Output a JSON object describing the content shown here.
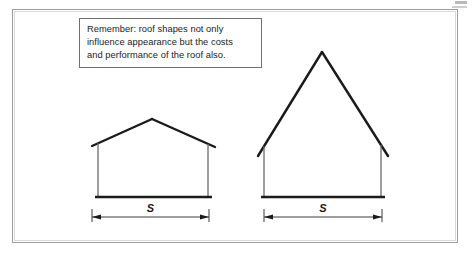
{
  "figure": {
    "background_color": "#ffffff",
    "line_color": "#1b1b1b",
    "frame_color": "#9d9d9d"
  },
  "note": {
    "border_color": "#6f6f6f",
    "lines": [
      "Remember: roof shapes not only",
      "influence appearance but the costs",
      "and performance of the roof also."
    ],
    "text": "Remember: roof shapes not only influence appearance but the costs and performance of the roof also."
  },
  "houses": [
    {
      "name": "low-pitch-gable-house",
      "span_label": "S",
      "eave_left": {
        "x": 92,
        "y": 146
      },
      "eave_right": {
        "x": 215,
        "y": 147
      },
      "ridge": {
        "x": 152,
        "y": 119
      },
      "wall_left_x": 98,
      "wall_right_x": 208,
      "baseline_y": 197,
      "baseline_x1": 95,
      "baseline_x2": 212
    },
    {
      "name": "steep-pitch-gable-house",
      "span_label": "S",
      "eave_left": {
        "x": 258,
        "y": 156
      },
      "eave_right": {
        "x": 388,
        "y": 156
      },
      "ridge": {
        "x": 322,
        "y": 52
      },
      "wall_left_x": 264,
      "wall_right_x": 381,
      "baseline_y": 197,
      "baseline_x1": 261,
      "baseline_x2": 385
    }
  ],
  "dimensions": [
    {
      "name": "span-dimension-left",
      "label": "S",
      "x1": 92,
      "x2": 209,
      "y": 217
    },
    {
      "name": "span-dimension-right",
      "label": "S",
      "x1": 264,
      "x2": 382,
      "y": 217
    }
  ]
}
